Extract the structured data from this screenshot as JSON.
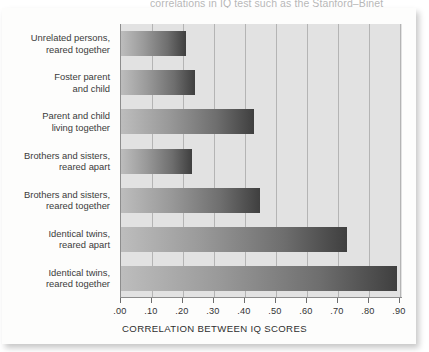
{
  "figure": {
    "cut_off_headline": "correlations in IQ test such as the Stanford–Binet",
    "background_color": "#e2e2e2",
    "bar_gradient_from": "#bdbdbd",
    "bar_gradient_to": "#3f3f3f"
  },
  "chart_data": {
    "type": "bar",
    "orientation": "horizontal",
    "title": "",
    "xlabel": "CORRELATION BETWEEN IQ SCORES",
    "ylabel": "",
    "xlim": [
      0.0,
      0.91
    ],
    "grid": true,
    "legend": "none",
    "categories": [
      "Unrelated persons,\nreared together",
      "Foster parent\nand child",
      "Parent and child\nliving together",
      "Brothers and sisters,\nreared apart",
      "Brothers and sisters,\nreared together",
      "Identical twins,\nreared apart",
      "Identical twins,\nreared together"
    ],
    "values": [
      0.21,
      0.24,
      0.43,
      0.23,
      0.45,
      0.73,
      0.89
    ],
    "xticks": [
      0.0,
      0.1,
      0.2,
      0.3,
      0.4,
      0.5,
      0.6,
      0.7,
      0.8,
      0.9
    ],
    "xticklabels": [
      ".00",
      ".10",
      ".20",
      ".30",
      ".40",
      ".50",
      ".60",
      ".70",
      ".80",
      ".90"
    ]
  }
}
